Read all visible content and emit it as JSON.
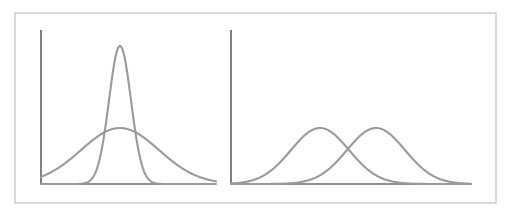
{
  "figure": {
    "background_color": "#ffffff",
    "frame": {
      "name": "outer-frame",
      "x": 15,
      "y": 13,
      "width": 481,
      "height": 190,
      "border_color": "#c8c8c8",
      "border_width": 1.4
    },
    "axis_color": "#6a6a6a",
    "axis_width": 1.7,
    "curve_color": "#9a9a9a",
    "curve_width": 2.1
  },
  "chart_data": [
    {
      "type": "line",
      "name": "left-panel",
      "title": "Same mean, different variance",
      "xlabel": "",
      "ylabel": "",
      "grid": false,
      "legend": "none",
      "axes": {
        "x_axis": {
          "x_start": 41,
          "x_end": 216,
          "y": 184
        },
        "y_axis": {
          "x": 41,
          "y_start": 30,
          "y_end": 184
        }
      },
      "xlim": [
        41,
        216
      ],
      "ylim": [
        184,
        30
      ],
      "series": [
        {
          "name": "narrow-high-variance-curve",
          "distribution": "normal",
          "mean_px": 120,
          "sigma_px": 11,
          "peak_y_px": 46,
          "baseline_y_px": 184,
          "amplitude_px": 138,
          "relative_peak_height": 1.0,
          "relative_sigma": 0.28
        },
        {
          "name": "wide-low-variance-curve",
          "distribution": "normal",
          "mean_px": 120,
          "sigma_px": 39,
          "peak_y_px": 128,
          "baseline_y_px": 184,
          "amplitude_px": 56,
          "relative_peak_height": 0.41,
          "relative_sigma": 1.0
        }
      ]
    },
    {
      "type": "line",
      "name": "right-panel",
      "title": "Different mean, same variance",
      "xlabel": "",
      "ylabel": "",
      "grid": false,
      "legend": "none",
      "axes": {
        "x_axis": {
          "x_start": 231,
          "x_end": 471,
          "y": 184
        },
        "y_axis": {
          "x": 231,
          "y_start": 30,
          "y_end": 184
        }
      },
      "xlim": [
        231,
        471
      ],
      "ylim": [
        184,
        30
      ],
      "series": [
        {
          "name": "left-shifted-curve",
          "distribution": "normal",
          "mean_px": 320,
          "sigma_px": 29,
          "peak_y_px": 128,
          "baseline_y_px": 184,
          "amplitude_px": 56,
          "relative_peak_height": 0.41,
          "relative_sigma": 1.0
        },
        {
          "name": "right-shifted-curve",
          "distribution": "normal",
          "mean_px": 376,
          "sigma_px": 29,
          "peak_y_px": 128,
          "baseline_y_px": 184,
          "amplitude_px": 56,
          "relative_peak_height": 0.41,
          "relative_sigma": 1.0
        }
      ]
    }
  ]
}
